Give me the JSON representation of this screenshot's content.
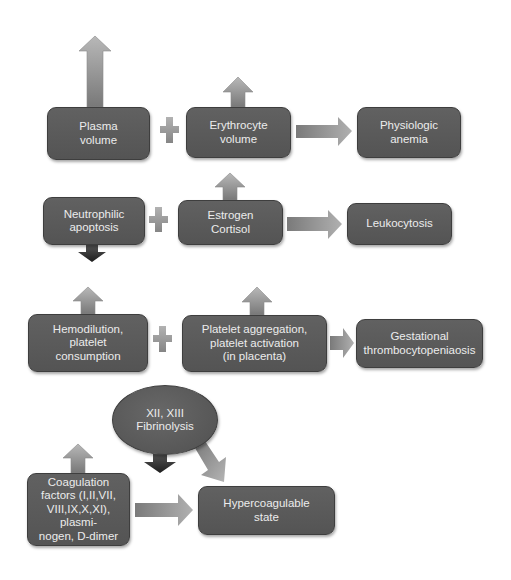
{
  "diagram": {
    "rows": [
      {
        "id": "anemia",
        "inputs": [
          {
            "label": "Plasma\nvolume",
            "change": "increase-large"
          },
          {
            "label": "Erythrocyte\nvolume",
            "change": "increase-small"
          }
        ],
        "operator": "+",
        "result": "Physiologic\nanemia"
      },
      {
        "id": "leukocytosis",
        "inputs": [
          {
            "label": "Neutrophilic\napoptosis",
            "change": "decrease"
          },
          {
            "label": "Estrogen\nCortisol",
            "change": "increase"
          }
        ],
        "operator": "+",
        "result": "Leukocytosis"
      },
      {
        "id": "thrombocytopenia",
        "inputs": [
          {
            "label": "Hemodilution,\nplatelet\nconsumption",
            "change": "increase"
          },
          {
            "label": "Platelet aggregation,\nplatelet activation\n(in placenta)",
            "change": "increase"
          }
        ],
        "operator": "+",
        "result": "Gestational\nthrombocytopeniaosis"
      },
      {
        "id": "hypercoagulable",
        "inputs": [
          {
            "label": "Coagulation\nfactors (I,II,VII,\nVIII,IX,X,XI), plasmi-\nnogen, D-dimer",
            "change": "increase"
          },
          {
            "label": "XII, XIII\nFibrinolysis",
            "change": "decrease"
          }
        ],
        "result": "Hypercoagulable\nstate"
      }
    ]
  },
  "colors": {
    "box_fill": "#5a5a5a",
    "box_text": "#ececec",
    "arrow_light": "#b4b4b4",
    "arrow_dark": "#7a7a7a",
    "decrease_arrow": "#2a2a2a",
    "background": "#ffffff"
  },
  "icons": {
    "increase": "up-arrow-icon",
    "decrease": "down-arrow-icon",
    "plus": "plus-icon",
    "leads_to": "right-arrow-icon"
  }
}
